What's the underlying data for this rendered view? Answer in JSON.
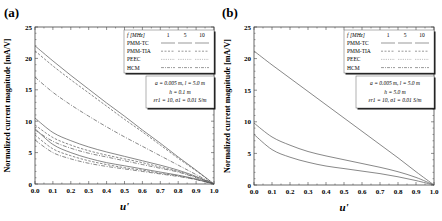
{
  "chart_data": [
    {
      "panel": "(a)",
      "type": "line",
      "xlabel": "u'",
      "ylabel": "Normalized current magnitude [mA/V]",
      "xlim": [
        0.0,
        1.0
      ],
      "ylim": [
        0,
        25
      ],
      "xticks": [
        "0.0",
        "0.1",
        "0.2",
        "0.3",
        "0.4",
        "0.5",
        "0.6",
        "0.7",
        "0.8",
        "0.9",
        "1.0"
      ],
      "yticks": [
        "0",
        "5",
        "10",
        "15",
        "20",
        "25"
      ],
      "legend": {
        "header": "f [MHz]",
        "freqs": [
          "1",
          "5",
          "10"
        ],
        "methods": [
          "PMM-TC",
          "PMM-TIA",
          "PEEC",
          "HCM"
        ]
      },
      "annotation": [
        "a = 0.005 m, l = 5.0 m",
        "h = 0.1 m",
        "εr1 = 10, σ1 = 0.01 S/m"
      ],
      "x": [
        0.0,
        0.1,
        0.2,
        0.3,
        0.4,
        0.5,
        0.6,
        0.7,
        0.8,
        0.9,
        1.0
      ],
      "series": [
        {
          "name": "1 MHz PMM-TC",
          "style": "solid",
          "values": [
            22.0,
            19.6,
            17.3,
            15.1,
            12.9,
            10.8,
            8.6,
            6.5,
            4.3,
            2.2,
            0
          ]
        },
        {
          "name": "1 MHz PMM-TIA",
          "style": "dash",
          "values": [
            21.2,
            18.8,
            16.6,
            14.5,
            12.4,
            10.3,
            8.3,
            6.2,
            4.1,
            2.1,
            0
          ]
        },
        {
          "name": "1 MHz HCM",
          "style": "dashdot",
          "values": [
            17.0,
            14.6,
            12.6,
            10.8,
            9.1,
            7.5,
            6.0,
            4.5,
            3.0,
            1.5,
            0
          ]
        },
        {
          "name": "5 MHz PMM-TC",
          "style": "solid",
          "values": [
            10.5,
            8.2,
            6.9,
            5.9,
            5.1,
            4.4,
            3.7,
            3.0,
            2.2,
            1.2,
            0
          ]
        },
        {
          "name": "5 MHz PMM-TIA",
          "style": "dash",
          "values": [
            9.4,
            7.4,
            6.2,
            5.3,
            4.6,
            4.0,
            3.4,
            2.7,
            2.0,
            1.1,
            0
          ]
        },
        {
          "name": "5 MHz HCM",
          "style": "dashdot",
          "values": [
            8.6,
            6.8,
            5.7,
            4.9,
            4.3,
            3.7,
            3.1,
            2.5,
            1.9,
            1.0,
            0
          ]
        },
        {
          "name": "10 MHz PMM-TC",
          "style": "solid",
          "values": [
            8.8,
            6.3,
            5.0,
            4.1,
            3.4,
            2.9,
            2.4,
            1.9,
            1.4,
            0.8,
            0
          ]
        },
        {
          "name": "10 MHz PMM-TIA",
          "style": "dash",
          "values": [
            7.8,
            5.6,
            4.5,
            3.7,
            3.1,
            2.6,
            2.2,
            1.7,
            1.3,
            0.7,
            0
          ]
        },
        {
          "name": "10 MHz HCM",
          "style": "dashdot",
          "values": [
            7.0,
            5.0,
            4.0,
            3.3,
            2.8,
            2.4,
            2.0,
            1.6,
            1.2,
            0.7,
            0
          ]
        }
      ]
    },
    {
      "panel": "(b)",
      "type": "line",
      "xlabel": "u'",
      "ylabel": "Normalized current magnitude [mA/V]",
      "xlim": [
        0.0,
        1.0
      ],
      "ylim": [
        0,
        25
      ],
      "xticks": [
        "0.0",
        "0.1",
        "0.2",
        "0.3",
        "0.4",
        "0.5",
        "0.6",
        "0.7",
        "0.8",
        "0.9",
        "1.0"
      ],
      "yticks": [
        "0",
        "5",
        "10",
        "15",
        "20",
        "25"
      ],
      "legend": {
        "header": "f [MHz]",
        "freqs": [
          "1",
          "5",
          "10"
        ],
        "methods": [
          "PMM-TC",
          "PMM-TIA",
          "PEEC",
          "HCM"
        ]
      },
      "annotation": [
        "a = 0.005 m, l = 5.0 m",
        "h = 5.0 m",
        "εr1 = 10, σ1 = 0.01 S/m"
      ],
      "x": [
        0.0,
        0.1,
        0.2,
        0.3,
        0.4,
        0.5,
        0.6,
        0.7,
        0.8,
        0.9,
        1.0
      ],
      "series": [
        {
          "name": "1 MHz",
          "style": "solid",
          "values": [
            21.2,
            19.0,
            16.9,
            14.8,
            12.7,
            10.6,
            8.5,
            6.4,
            4.3,
            2.1,
            0
          ]
        },
        {
          "name": "5 MHz",
          "style": "solid",
          "values": [
            9.8,
            7.6,
            6.3,
            5.3,
            4.6,
            4.0,
            3.4,
            2.8,
            2.1,
            1.2,
            0
          ]
        },
        {
          "name": "10 MHz",
          "style": "solid",
          "values": [
            8.0,
            5.6,
            4.4,
            3.6,
            3.0,
            2.6,
            2.2,
            1.8,
            1.3,
            0.7,
            0
          ]
        }
      ]
    }
  ],
  "panels": [
    {
      "label": "(a)"
    },
    {
      "label": "(b)"
    }
  ]
}
